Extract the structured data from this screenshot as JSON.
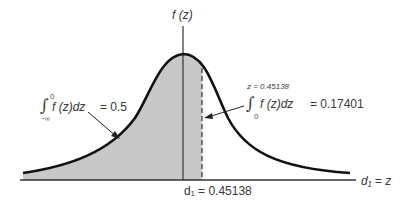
{
  "diagram": {
    "type": "standard-normal-density",
    "y_axis_label": "f (z)",
    "x_axis_label": "d₁ = z",
    "fill_color": "#c8c8c8",
    "curve_color": "#111111",
    "left_area": {
      "integral_upper": "0",
      "integral_lower": "−∞",
      "integrand": "f (z)dz",
      "equals": "= 0.5"
    },
    "right_area": {
      "upper_limit": "z = 0.45138",
      "integral_lower": "0",
      "integrand": "f (z)dz",
      "equals": "= 0.17401"
    },
    "d1_marker": {
      "label": "d₁ = 0.45138",
      "value": 0.45138
    }
  }
}
